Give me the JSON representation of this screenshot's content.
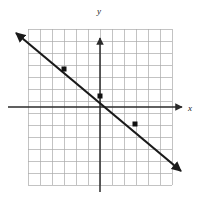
{
  "figure": {
    "title": "",
    "width": 206,
    "height": 204,
    "background_color": "#ffffff"
  },
  "axes": {
    "x_label": "x",
    "y_label": "y",
    "axis_color": "#2b2b2b",
    "grid_color": "#a9a9a9",
    "grid_visible": true,
    "grid_columns": 12,
    "grid_rows": 13,
    "grid_step_px": 12,
    "origin_px": {
      "x": 100,
      "y": 107
    },
    "grid_bounds_px": {
      "left": 28,
      "top": 29,
      "right": 172,
      "bottom": 185
    },
    "x_axis_px": {
      "x1": 8,
      "y1": 107,
      "x2": 182,
      "y2": 107
    },
    "y_axis_px": {
      "x1": 100,
      "y1": 40,
      "x2": 100,
      "y2": 192
    },
    "x_range": [
      -6,
      6
    ],
    "y_range": [
      -6.5,
      6.5
    ]
  },
  "chart_data": {
    "type": "line",
    "title": "",
    "xlabel": "x",
    "ylabel": "y",
    "xlim": [
      -6,
      6
    ],
    "ylim": [
      -6.5,
      6.5
    ],
    "grid": true,
    "legend": "none",
    "series": [
      {
        "name": "line",
        "color": "#1a1a1a",
        "slope": -0.75,
        "intercept": 0.9,
        "equation": "y = -3/4 x + 1",
        "arrow_both_ends": true,
        "x": [
          -7.2,
          7.1
        ],
        "values": [
          6.3,
          -5.7
        ],
        "endpoints_px": [
          {
            "x": 15,
            "y": 32
          },
          {
            "x": 182,
            "y": 172
          }
        ]
      }
    ],
    "points": [
      {
        "label": "",
        "x": -3,
        "y": 3.2,
        "px": {
          "x": 64,
          "y": 69
        }
      },
      {
        "label": "",
        "x": 0,
        "y": 0.9,
        "px": {
          "x": 100,
          "y": 96
        }
      },
      {
        "label": "",
        "x": 2.9,
        "y": -1.4,
        "px": {
          "x": 135,
          "y": 124
        }
      }
    ],
    "point_marker": {
      "shape": "square",
      "color": "#111111",
      "size_px": 5
    }
  }
}
